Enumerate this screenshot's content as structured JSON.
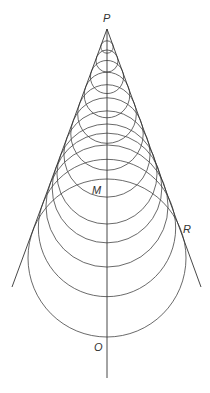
{
  "diagram": {
    "type": "geometric-construction",
    "labels": {
      "apex": "P",
      "midpoint": "M",
      "tangent_point": "R",
      "bottom": "O"
    },
    "apex": [
      107,
      29
    ],
    "axis_end_y": 378,
    "left_line_end": [
      12,
      287
    ],
    "right_line_end": [
      201,
      287
    ],
    "circle_center_distances": [
      18,
      32,
      48,
      66,
      85,
      105,
      125,
      145,
      159,
      177,
      199,
      229
    ],
    "sin_half_angle": 0.345,
    "colors": {
      "stroke": "#333333",
      "background": "#ffffff"
    }
  }
}
